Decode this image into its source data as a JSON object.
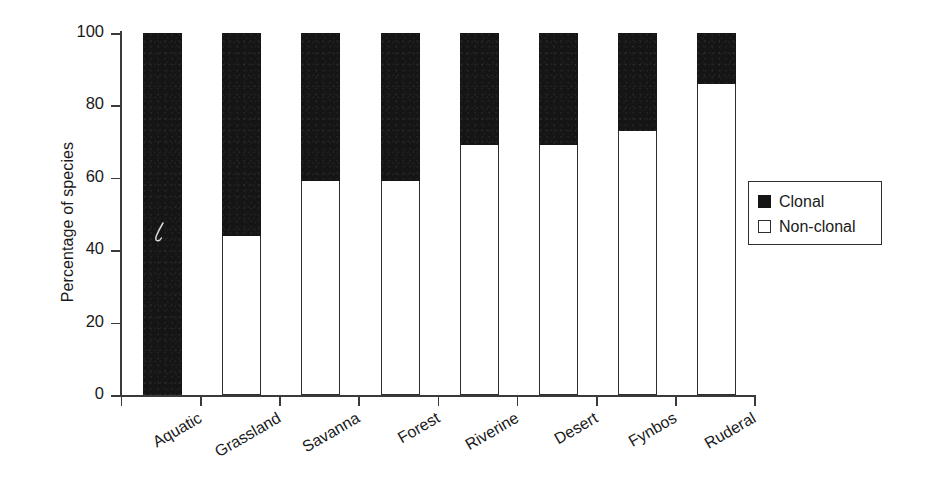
{
  "chart_data": {
    "type": "bar",
    "subtype": "stacked-percentage",
    "title": "",
    "xlabel": "",
    "ylabel": "Percentage of species",
    "ylim": [
      0,
      100
    ],
    "yticks": [
      0,
      20,
      40,
      60,
      80,
      100
    ],
    "ytick_labels": [
      "0",
      "20",
      "40",
      "60",
      "80",
      "100"
    ],
    "grid": false,
    "legend_position": "right",
    "categories": [
      "Aquatic",
      "Grassland",
      "Savanna",
      "Forest",
      "Riverine",
      "Desert",
      "Fynbos",
      "Ruderal"
    ],
    "series": [
      {
        "name": "Non-clonal",
        "color": "#ffffff",
        "values": [
          0,
          44,
          59,
          59,
          69,
          69,
          73,
          86
        ]
      },
      {
        "name": "Clonal",
        "color": "#151515",
        "values": [
          100,
          56,
          41,
          41,
          31,
          31,
          27,
          14
        ]
      }
    ]
  },
  "legend": {
    "items": [
      {
        "label": "Clonal",
        "swatch": "filled-square-icon"
      },
      {
        "label": "Non-clonal",
        "swatch": "hollow-square-icon"
      }
    ]
  },
  "axes": {
    "y_title": "Percentage of species",
    "y_tick_labels": [
      "100",
      "80",
      "60",
      "40",
      "20",
      "0"
    ],
    "x_tick_labels": [
      "Aquatic",
      "Grassland",
      "Savanna",
      "Forest",
      "Riverine",
      "Desert",
      "Fynbos",
      "Ruderal"
    ]
  }
}
